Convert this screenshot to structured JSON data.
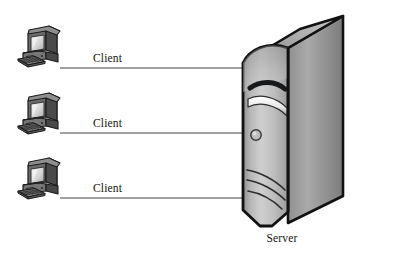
{
  "diagram": {
    "background_color": "#ffffff",
    "type": "network-topology",
    "link_color": "#808080",
    "text_color": "#141414",
    "clients": [
      {
        "id": "client-1",
        "label": "Client",
        "label_x": 93,
        "label_y": 52,
        "icon_x": 16,
        "icon_y": 26,
        "line_y": 68,
        "line_x1": 60,
        "line_x2": 243
      },
      {
        "id": "client-2",
        "label": "Client",
        "label_x": 93,
        "label_y": 117,
        "icon_x": 16,
        "icon_y": 93,
        "line_y": 133,
        "line_x1": 60,
        "line_x2": 243
      },
      {
        "id": "client-3",
        "label": "Client",
        "label_x": 93,
        "label_y": 182,
        "icon_x": 16,
        "icon_y": 158,
        "line_y": 198,
        "line_x1": 60,
        "line_x2": 243
      }
    ],
    "server": {
      "id": "server-1",
      "label": "Server",
      "label_x": 222,
      "label_y": 232,
      "tower_x": 233,
      "tower_y": 14,
      "tower_width": 110,
      "tower_height": 212,
      "face_color_light": "#d2d2d2",
      "face_color_mid": "#a8a8a8",
      "face_color_dark": "#707070",
      "outline_color": "#111111",
      "power_button": "circular-power-button",
      "drive_slot": "optical-drive-slot",
      "vents": 3
    },
    "icons": {
      "client": "desktop-computer-icon",
      "server": "server-tower-icon",
      "link": "network-cable-line"
    }
  }
}
